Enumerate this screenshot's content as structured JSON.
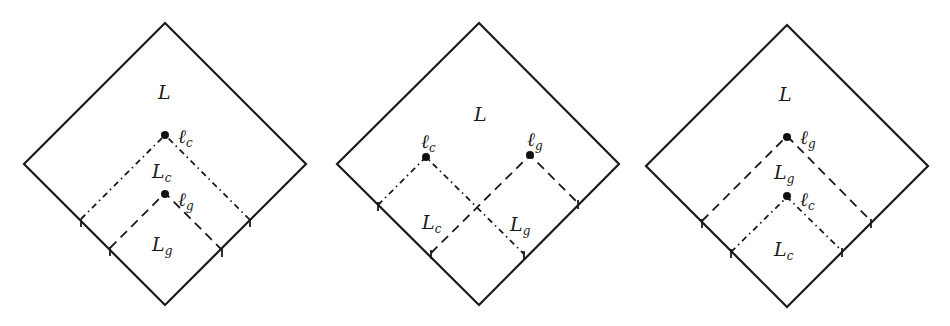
{
  "figure": {
    "panels": [
      {
        "id": "left",
        "region_label": "L",
        "points": [
          {
            "name": "ℓ",
            "sub": "c",
            "line": "dash-dot"
          },
          {
            "name": "ℓ",
            "sub": "g",
            "line": "dashed"
          }
        ],
        "regions": [
          {
            "name": "L",
            "sub": "c"
          },
          {
            "name": "L",
            "sub": "g"
          }
        ],
        "description": "ℓ_g lies inside the light-cone region L_c of ℓ_c (nested)"
      },
      {
        "id": "middle",
        "region_label": "L",
        "points": [
          {
            "name": "ℓ",
            "sub": "c",
            "line": "dash-dot"
          },
          {
            "name": "ℓ",
            "sub": "g",
            "line": "dashed"
          }
        ],
        "regions": [
          {
            "name": "L",
            "sub": "c"
          },
          {
            "name": "L",
            "sub": "g"
          }
        ],
        "description": "ℓ_c and ℓ_g side by side, their regions overlap"
      },
      {
        "id": "right",
        "region_label": "L",
        "points": [
          {
            "name": "ℓ",
            "sub": "g",
            "line": "dashed"
          },
          {
            "name": "ℓ",
            "sub": "c",
            "line": "dash-dot"
          }
        ],
        "regions": [
          {
            "name": "L",
            "sub": "g"
          },
          {
            "name": "L",
            "sub": "c"
          }
        ],
        "description": "ℓ_c lies inside the region L_g of ℓ_g (nested)"
      }
    ]
  }
}
